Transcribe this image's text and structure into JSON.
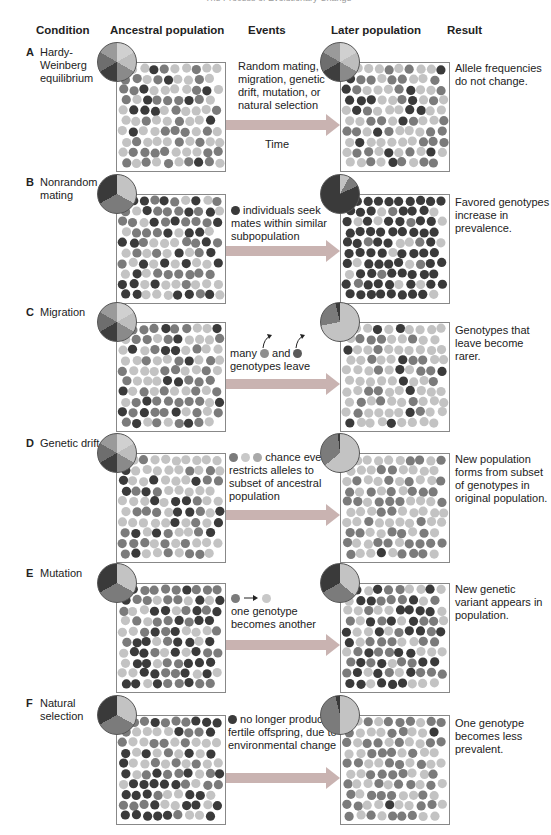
{
  "running_head": "The Process of Evolutionary Change",
  "columns": {
    "condition": "Condition",
    "ancestral": "Ancestral population",
    "events": "Events",
    "later": "Later population",
    "result": "Result"
  },
  "colors": {
    "light": "#c3c3c3",
    "medium": "#7b7b7b",
    "dark": "#3a3a3a",
    "arrow": "#c9b3b1"
  },
  "rows": [
    {
      "letter": "A",
      "condition": "Hardy-Weinberg equilibrium",
      "events": "Random mating, no migration, genetic drift, mutation, or natural selection",
      "time_label": "Time",
      "result": "Allele frequencies do not change.",
      "ancestral_pie": {
        "light": 50,
        "medium": 33,
        "dark": 17
      },
      "later_pie": {
        "light": 50,
        "medium": 33,
        "dark": 17
      }
    },
    {
      "letter": "B",
      "condition": "Nonrandom mating",
      "events": "individuals seek mates within similar subpopulation",
      "result": "Favored genotypes increase in prevalence.",
      "ancestral_pie": {
        "light": 33,
        "medium": 34,
        "dark": 33
      },
      "later_pie": {
        "light": 8,
        "medium": 10,
        "dark": 82
      }
    },
    {
      "letter": "C",
      "condition": "Migration",
      "events_prefix": "many",
      "events_mid": "and",
      "events_suffix": "genotypes leave",
      "result": "Genotypes that leave become rarer.",
      "ancestral_pie": {
        "light": 50,
        "medium": 33,
        "dark": 17
      },
      "later_pie": {
        "light": 72,
        "medium": 24,
        "dark": 4
      }
    },
    {
      "letter": "D",
      "condition": "Genetic drift",
      "events": "chance event restricts alleles to subset of ancestral population",
      "result": "New population forms from subset of genotypes in original population.",
      "ancestral_pie": {
        "light": 50,
        "medium": 33,
        "dark": 17
      },
      "later_pie": {
        "light": 64,
        "medium": 34,
        "dark": 2
      }
    },
    {
      "letter": "E",
      "condition": "Mutation",
      "events": "one genotype becomes another",
      "result": "New genetic variant appears in population.",
      "ancestral_pie": {
        "light": 33,
        "medium": 34,
        "dark": 33
      },
      "later_pie": {
        "light": 36,
        "medium": 31,
        "dark": 33
      }
    },
    {
      "letter": "F",
      "condition": "Natural selection",
      "events": "no longer produces fertile offspring, due to environmental change",
      "result": "One genotype becomes less prevalent.",
      "ancestral_pie": {
        "light": 33,
        "medium": 34,
        "dark": 33
      },
      "later_pie": {
        "light": 50,
        "medium": 46,
        "dark": 4
      }
    }
  ]
}
